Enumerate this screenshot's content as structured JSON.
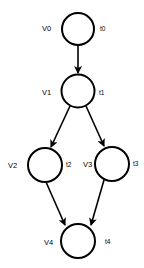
{
  "diagram": {
    "type": "directed-graph",
    "nodes": [
      {
        "id": "V0",
        "label": "V0",
        "time_label": "t0",
        "cx": 78,
        "cy": 29,
        "r": 16
      },
      {
        "id": "V1",
        "label": "V1",
        "time_label": "t1",
        "cx": 78,
        "cy": 91,
        "r": 16.5
      },
      {
        "id": "V2",
        "label": "V2",
        "time_label": "t2",
        "cx": 45,
        "cy": 165,
        "r": 17
      },
      {
        "id": "V3",
        "label": "V3",
        "time_label": "t3",
        "cx": 112,
        "cy": 164,
        "r": 17
      },
      {
        "id": "V4",
        "label": "V4",
        "time_label": "t4",
        "cx": 78,
        "cy": 241,
        "r": 17
      }
    ],
    "edges": [
      {
        "from": "V0",
        "to": "V1"
      },
      {
        "from": "V1",
        "to": "V2"
      },
      {
        "from": "V1",
        "to": "V3"
      },
      {
        "from": "V2",
        "to": "V4"
      },
      {
        "from": "V3",
        "to": "V4"
      }
    ],
    "colors": {
      "stroke": "#000000",
      "fill": "#ffffff",
      "background": "#ffffff"
    }
  }
}
